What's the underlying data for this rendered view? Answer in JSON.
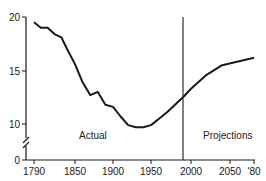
{
  "chart_data": {
    "type": "line",
    "title": "",
    "xlabel": "",
    "ylabel": "",
    "xlim": [
      1780,
      2080
    ],
    "ylim": [
      0,
      20
    ],
    "grid": false,
    "y_axis_break": true,
    "x_ticks": [
      1790,
      1850,
      1900,
      1950,
      2000,
      2050,
      2080
    ],
    "x_tick_labels": [
      "1790",
      "1850",
      "1900",
      "1950",
      "2000",
      "2050",
      "'80"
    ],
    "y_ticks": [
      0,
      10,
      15,
      20
    ],
    "y_tick_labels": [
      "0",
      "10",
      "15",
      "20"
    ],
    "divider_year": 1990,
    "annotations": [
      {
        "text": "Actual",
        "region": "before 1990"
      },
      {
        "text": "Projections",
        "region": "after 1990"
      }
    ],
    "series": [
      {
        "name": "Actual",
        "x": [
          1790,
          1800,
          1810,
          1820,
          1830,
          1840,
          1850,
          1860,
          1870,
          1880,
          1890,
          1900,
          1910,
          1920,
          1930,
          1940,
          1950,
          1960,
          1970,
          1980,
          1990
        ],
        "values": [
          19.5,
          19.0,
          19.0,
          18.4,
          18.1,
          16.8,
          15.6,
          13.9,
          12.7,
          13.0,
          11.8,
          11.6,
          10.7,
          9.9,
          9.7,
          9.7,
          9.9,
          10.5,
          11.1,
          11.8,
          12.5
        ]
      },
      {
        "name": "Projections",
        "x": [
          1990,
          2000,
          2020,
          2040,
          2080
        ],
        "values": [
          12.5,
          13.3,
          14.6,
          15.5,
          16.2
        ]
      }
    ]
  },
  "labels": {
    "actual": "Actual",
    "projections": "Projections",
    "y20": "20",
    "y15": "15",
    "y10": "10",
    "y0": "0",
    "x1790": "1790",
    "x1850": "1850",
    "x1900": "1900",
    "x1950": "1950",
    "x2000": "2000",
    "x2050": "2050",
    "x2080": "'80"
  }
}
